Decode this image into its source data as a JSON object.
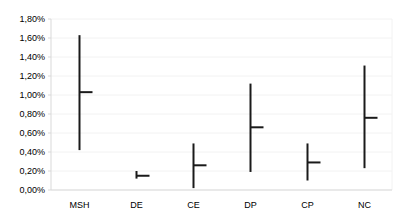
{
  "chart_data": {
    "type": "high-low-close",
    "title": "",
    "xlabel": "",
    "ylabel": "",
    "categories": [
      "MSH",
      "DE",
      "CE",
      "DP",
      "CP",
      "NC"
    ],
    "series": [
      {
        "name": "High",
        "values": [
          1.63,
          0.2,
          0.49,
          1.12,
          0.49,
          1.31
        ]
      },
      {
        "name": "Low",
        "values": [
          0.42,
          0.12,
          0.02,
          0.19,
          0.1,
          0.23
        ]
      },
      {
        "name": "Close",
        "values": [
          1.03,
          0.15,
          0.26,
          0.66,
          0.29,
          0.76
        ]
      }
    ],
    "ylim": [
      0,
      1.8
    ],
    "yticks": [
      0,
      0.2,
      0.4,
      0.6,
      0.8,
      1.0,
      1.2,
      1.4,
      1.6,
      1.8
    ],
    "ytick_labels": [
      "0,00%",
      "0,20%",
      "0,40%",
      "0,60%",
      "0,80%",
      "1,00%",
      "1,20%",
      "1,40%",
      "1,60%",
      "1,80%"
    ],
    "grid": true,
    "legend": "none",
    "colors": {
      "line": "#1a1a1a",
      "grid": "#f2f2f2",
      "axis": "#d9d9d9"
    }
  }
}
